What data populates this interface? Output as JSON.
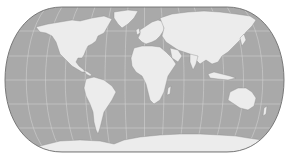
{
  "map": {
    "projection": "pseudo-cylindrical world map (flat-polar, rounded sides)",
    "colors": {
      "background": "#ffffff",
      "ocean": "#a9a9a9",
      "land": "#ececec",
      "graticule": "#d6d6d6",
      "outline": "#6e6e6e",
      "coast_detail": "#8a8a8a"
    },
    "bounds": {
      "left": 5,
      "right": 284,
      "top": 7,
      "bottom": 152
    },
    "features": [
      {
        "name": "North America"
      },
      {
        "name": "South America"
      },
      {
        "name": "Greenland"
      },
      {
        "name": "Europe"
      },
      {
        "name": "Africa"
      },
      {
        "name": "Asia"
      },
      {
        "name": "Australia"
      },
      {
        "name": "Antarctica"
      }
    ],
    "graticule": {
      "parallels": true,
      "meridians": true
    }
  }
}
